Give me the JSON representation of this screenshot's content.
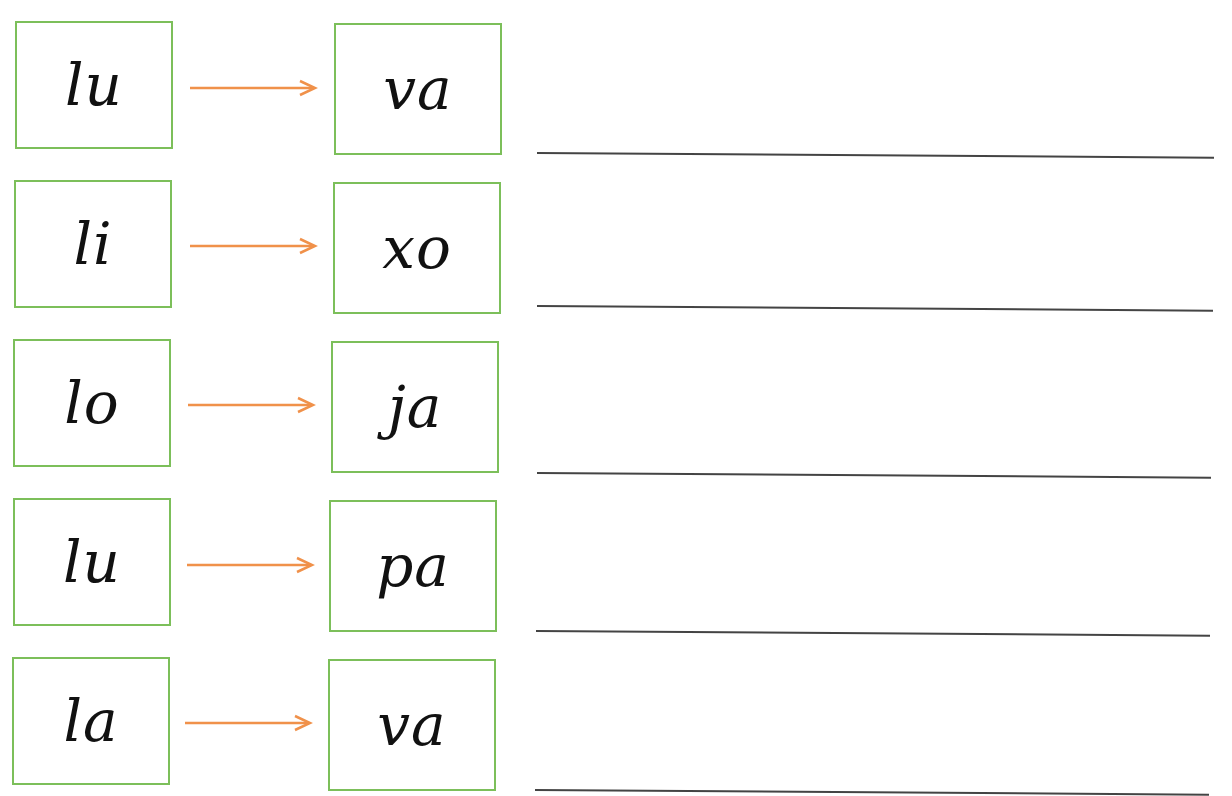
{
  "worksheet": {
    "accent_colors": {
      "box_border": "#7cbf5a",
      "arrow": "#f0914a",
      "line": "#444444"
    },
    "rows": [
      {
        "left": "lu",
        "right": "va",
        "answer": ""
      },
      {
        "left": "li",
        "right": "xo",
        "answer": ""
      },
      {
        "left": "lo",
        "right": "ja",
        "answer": ""
      },
      {
        "left": "lu",
        "right": "pa",
        "answer": ""
      },
      {
        "left": "la",
        "right": "va",
        "answer": ""
      }
    ]
  }
}
